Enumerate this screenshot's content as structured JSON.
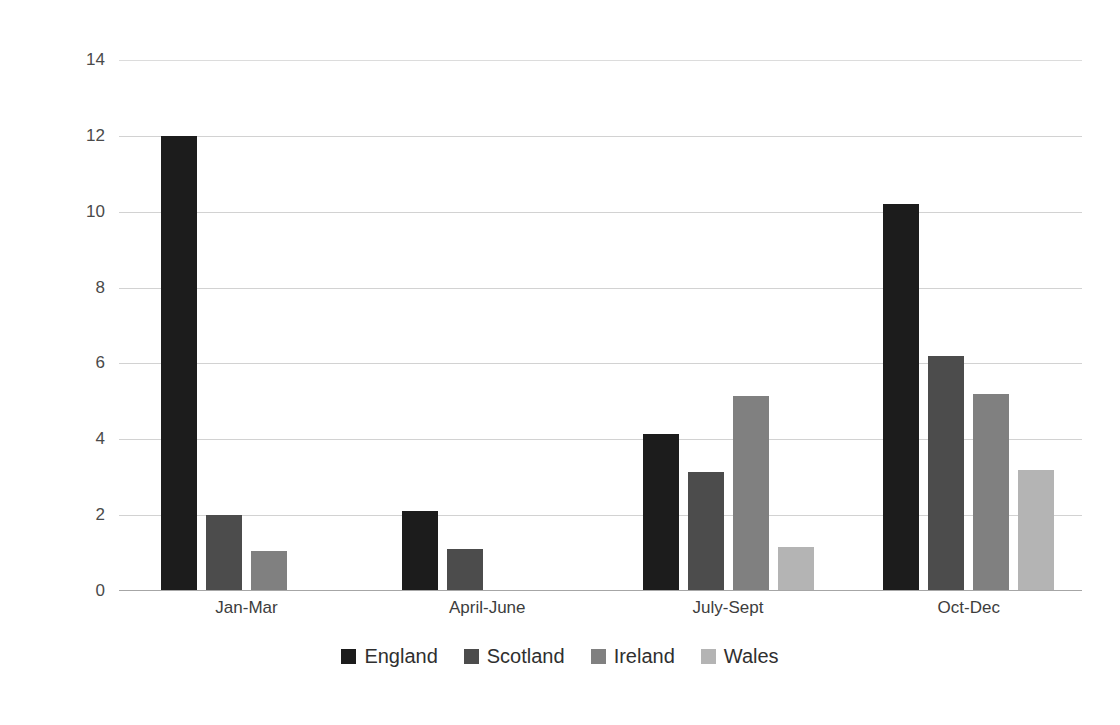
{
  "chart_data": {
    "type": "bar",
    "title": "",
    "xlabel": "",
    "ylabel": "No. of people",
    "categories": [
      "Jan-Mar",
      "April-June",
      "July-Sept",
      "Oct-Dec"
    ],
    "series": [
      {
        "name": "England",
        "color": "#1c1c1c",
        "values": [
          12.0,
          2.1,
          4.15,
          10.2
        ]
      },
      {
        "name": "Scotland",
        "color": "#4c4c4c",
        "values": [
          2.0,
          1.1,
          3.15,
          6.2
        ]
      },
      {
        "name": "Ireland",
        "color": "#808080",
        "values": [
          1.05,
          0,
          5.15,
          5.2
        ]
      },
      {
        "name": "Wales",
        "color": "#b4b4b4",
        "values": [
          0,
          0,
          1.15,
          3.2
        ]
      }
    ],
    "ylim": [
      0,
      14
    ],
    "yticks": [
      0,
      2,
      4,
      6,
      8,
      10,
      12,
      14
    ],
    "ytick_labels": [
      "0",
      "2",
      "4",
      "6",
      "8",
      "10",
      "12",
      "14"
    ],
    "grid": true,
    "grid_axis": "y",
    "legend_position": "bottom"
  },
  "figure": {
    "background_color": "#ffffff",
    "axis_line_color": "#a6a6a6",
    "gridline_color": "#d2d2d2",
    "tick_label_color": "#4a4a4a"
  }
}
